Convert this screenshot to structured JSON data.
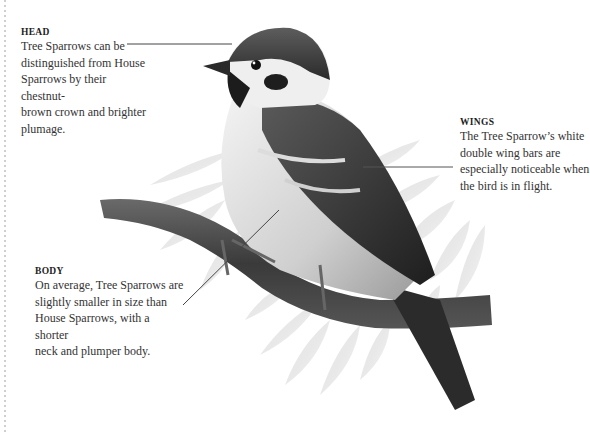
{
  "figure": {
    "style": "grayscale illustration",
    "colors": {
      "text": "#333333",
      "leader_line": "#444444",
      "border_dots": "#cfcfcf"
    }
  },
  "callouts": {
    "head": {
      "title": "HEAD",
      "lines": [
        "Tree Sparrows can be",
        "distinguished from House",
        "Sparrows by their chestnut-",
        "brown crown and brighter",
        "plumage."
      ]
    },
    "wings": {
      "title": "WINGS",
      "lines": [
        "The Tree Sparrow’s white",
        "double wing bars are",
        "especially noticeable when",
        "the bird is in flight."
      ]
    },
    "body": {
      "title": "BODY",
      "lines": [
        "On average, Tree Sparrows are",
        "slightly smaller in size than",
        "House Sparrows, with a shorter",
        "neck and plumper body."
      ]
    }
  }
}
